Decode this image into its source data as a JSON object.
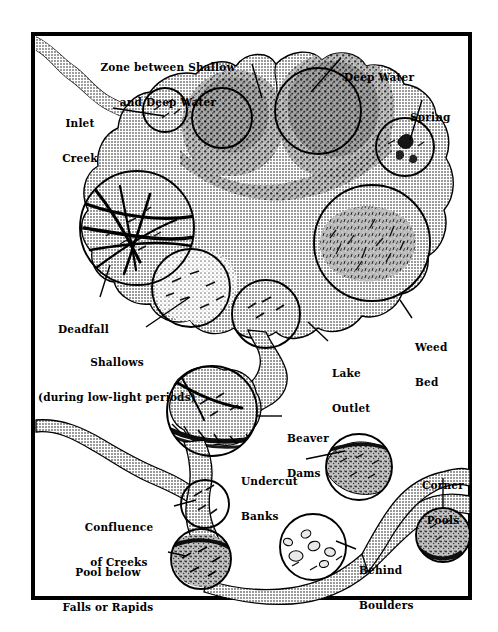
{
  "figure": {
    "frame": {
      "border_color": "#000000",
      "background": "#ffffff"
    },
    "palette": {
      "water_fill": "#b9b9b9",
      "shallow_fill": "#e8e8e8",
      "deep_fill": "#3a3a3a",
      "outline": "#000000",
      "paper": "#ffffff"
    },
    "labels": [
      {
        "id": "zone-between-shallow-and-deep-water",
        "lines": [
          "Zone between Shallow",
          "and Deep Water"
        ],
        "align": "center",
        "x": 168,
        "y": 38
      },
      {
        "id": "deep-water",
        "lines": [
          "Deep Water"
        ],
        "align": "left",
        "x": 344,
        "y": 48
      },
      {
        "id": "inlet-creek",
        "lines": [
          "Inlet",
          "Creek"
        ],
        "align": "center",
        "x": 80,
        "y": 94
      },
      {
        "id": "spring",
        "lines": [
          "Spring"
        ],
        "align": "left",
        "x": 410,
        "y": 88
      },
      {
        "id": "deadfall",
        "lines": [
          "Deadfall"
        ],
        "align": "left",
        "x": 64,
        "y": 300
      },
      {
        "id": "shallows",
        "lines": [
          "Shallows",
          "(during low-light periods)"
        ],
        "align": "center",
        "x": 97,
        "y": 333
      },
      {
        "id": "lake-outlet",
        "lines": [
          "Lake",
          "Outlet"
        ],
        "align": "left",
        "x": 331,
        "y": 344
      },
      {
        "id": "weed-bed",
        "lines": [
          "Weed",
          "Bed"
        ],
        "align": "left",
        "x": 415,
        "y": 321
      },
      {
        "id": "beaver-dams",
        "lines": [
          "Beaver",
          "Dams"
        ],
        "align": "left",
        "x": 285,
        "y": 411
      },
      {
        "id": "undercut-banks",
        "lines": [
          "Undercut",
          "Banks"
        ],
        "align": "left",
        "x": 257,
        "y": 455
      },
      {
        "id": "corner-pools",
        "lines": [
          "Corner",
          "Pools"
        ],
        "align": "center",
        "x": 443,
        "y": 462
      },
      {
        "id": "confluence-of-creeks",
        "lines": [
          "Confluence",
          "of Creeks"
        ],
        "align": "center",
        "x": 126,
        "y": 502
      },
      {
        "id": "pool-below-falls-or-rapids",
        "lines": [
          "Pool below",
          "Falls or Rapids"
        ],
        "align": "center",
        "x": 123,
        "y": 545
      },
      {
        "id": "behind-boulders",
        "lines": [
          "Behind",
          "Boulders"
        ],
        "align": "left",
        "x": 358,
        "y": 544
      }
    ],
    "callouts": [
      {
        "id": "callout-zone-between",
        "from": [
          252,
          64
        ],
        "to": [
          262,
          98
        ]
      },
      {
        "id": "callout-deep-water",
        "from": [
          341,
          58
        ],
        "to": [
          311,
          92
        ]
      },
      {
        "id": "callout-inlet-creek",
        "from": [
          113,
          108
        ],
        "to": [
          164,
          116
        ]
      },
      {
        "id": "callout-spring",
        "from": [
          422,
          100
        ],
        "to": [
          410,
          140
        ]
      },
      {
        "id": "callout-deadfall",
        "from": [
          100,
          297
        ],
        "to": [
          110,
          265
        ]
      },
      {
        "id": "callout-shallows",
        "from": [
          146,
          327
        ],
        "to": [
          190,
          297
        ]
      },
      {
        "id": "callout-lake-outlet",
        "from": [
          328,
          341
        ],
        "to": [
          308,
          322
        ]
      },
      {
        "id": "callout-weed-bed",
        "from": [
          412,
          318
        ],
        "to": [
          400,
          300
        ]
      },
      {
        "id": "callout-beaver-dams",
        "from": [
          282,
          416
        ],
        "to": [
          256,
          416
        ]
      },
      {
        "id": "callout-undercut-banks",
        "from": [
          306,
          459
        ],
        "to": [
          345,
          451
        ]
      },
      {
        "id": "callout-corner-pools",
        "from": [
          443,
          478
        ],
        "to": [
          443,
          504
        ]
      },
      {
        "id": "callout-confluence",
        "from": [
          174,
          506
        ],
        "to": [
          196,
          500
        ]
      },
      {
        "id": "callout-pool-below-falls",
        "from": [
          168,
          552
        ],
        "to": [
          186,
          556
        ]
      },
      {
        "id": "callout-behind-boulders",
        "from": [
          356,
          549
        ],
        "to": [
          336,
          541
        ]
      }
    ],
    "feature_circles": [
      {
        "id": "circle-inlet-creek",
        "cx": 165,
        "cy": 110,
        "r": 22
      },
      {
        "id": "circle-zone-between",
        "cx": 222,
        "cy": 118,
        "r": 30
      },
      {
        "id": "circle-deep-water",
        "cx": 318,
        "cy": 111,
        "r": 43
      },
      {
        "id": "circle-spring",
        "cx": 405,
        "cy": 147,
        "r": 29
      },
      {
        "id": "circle-deadfall",
        "cx": 137,
        "cy": 228,
        "r": 57
      },
      {
        "id": "circle-weed-bed",
        "cx": 372,
        "cy": 243,
        "r": 58
      },
      {
        "id": "circle-shallows",
        "cx": 191,
        "cy": 288,
        "r": 39
      },
      {
        "id": "circle-lake-outlet",
        "cx": 266,
        "cy": 314,
        "r": 34
      },
      {
        "id": "circle-beaver-dams",
        "cx": 212,
        "cy": 411,
        "r": 45
      },
      {
        "id": "circle-undercut-banks",
        "cx": 359,
        "cy": 467,
        "r": 33
      },
      {
        "id": "circle-corner-pools",
        "cx": 443,
        "cy": 535,
        "r": 27
      },
      {
        "id": "circle-confluence",
        "cx": 205,
        "cy": 504,
        "r": 24
      },
      {
        "id": "circle-behind-boulders",
        "cx": 313,
        "cy": 547,
        "r": 33
      },
      {
        "id": "circle-pool-below-falls",
        "cx": 201,
        "cy": 559,
        "r": 30
      }
    ]
  }
}
